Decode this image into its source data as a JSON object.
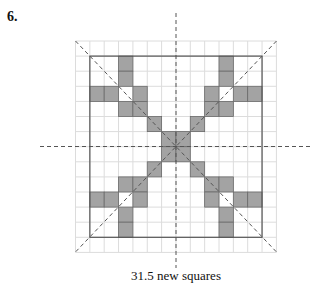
{
  "problem": {
    "number": "6.",
    "caption": "31.5 new squares",
    "cutoff_text": ""
  },
  "colors": {
    "shade": "#a3a3a3",
    "grid": "#dcdcdc",
    "border": "#555555",
    "dash": "#555555"
  },
  "grid": {
    "outer_cols": 14,
    "outer_rows": 14,
    "inner_cols": 12,
    "inner_rows": 12,
    "outer_origin": [
      75.5,
      41
    ],
    "cell_w": 14.35,
    "cell_h": 15.1,
    "shaded_cells_inner": [
      [
        2,
        0
      ],
      [
        2,
        1
      ],
      [
        0,
        2
      ],
      [
        1,
        2
      ],
      [
        3,
        2
      ],
      [
        2,
        3
      ],
      [
        3,
        3
      ],
      [
        4,
        4
      ],
      [
        9,
        0
      ],
      [
        9,
        1
      ],
      [
        8,
        2
      ],
      [
        10,
        2
      ],
      [
        11,
        2
      ],
      [
        8,
        3
      ],
      [
        9,
        3
      ],
      [
        7,
        4
      ],
      [
        5,
        5
      ],
      [
        6,
        5
      ],
      [
        5,
        6
      ],
      [
        6,
        6
      ],
      [
        4,
        7
      ],
      [
        2,
        8
      ],
      [
        3,
        8
      ],
      [
        0,
        9
      ],
      [
        1,
        9
      ],
      [
        3,
        9
      ],
      [
        2,
        10
      ],
      [
        2,
        11
      ],
      [
        7,
        7
      ],
      [
        8,
        8
      ],
      [
        9,
        8
      ],
      [
        8,
        9
      ],
      [
        10,
        9
      ],
      [
        11,
        9
      ],
      [
        9,
        10
      ],
      [
        9,
        11
      ]
    ]
  },
  "symmetry_lines": [
    {
      "name": "vertical-axis",
      "from": [
        176,
        13
      ],
      "to": [
        176,
        268
      ]
    },
    {
      "name": "horizontal-axis",
      "from": [
        40,
        146.5
      ],
      "to": [
        310,
        146.5
      ]
    },
    {
      "name": "diagonal-main",
      "from": [
        75.5,
        41
      ],
      "to": [
        276.5,
        252
      ]
    },
    {
      "name": "diagonal-anti",
      "from": [
        276.5,
        41
      ],
      "to": [
        75.5,
        252
      ]
    }
  ]
}
